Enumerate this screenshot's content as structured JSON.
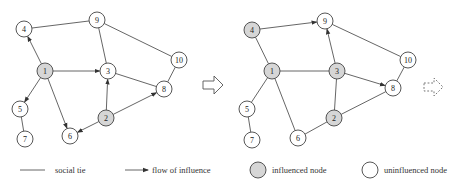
{
  "colors": {
    "influenced_fill": "#d6d6d6",
    "uninfluenced_fill": "#ffffff",
    "stroke": "#444444"
  },
  "graphs": [
    {
      "name": "before",
      "nodes": [
        {
          "id": "1",
          "x": 45,
          "y": 71,
          "influenced": true
        },
        {
          "id": "2",
          "x": 106,
          "y": 118,
          "influenced": true
        },
        {
          "id": "3",
          "x": 108,
          "y": 71,
          "influenced": false
        },
        {
          "id": "4",
          "x": 24,
          "y": 29,
          "influenced": false
        },
        {
          "id": "5",
          "x": 20,
          "y": 109,
          "influenced": false
        },
        {
          "id": "6",
          "x": 70,
          "y": 136,
          "influenced": false
        },
        {
          "id": "7",
          "x": 25,
          "y": 139,
          "influenced": false
        },
        {
          "id": "8",
          "x": 164,
          "y": 89,
          "influenced": false
        },
        {
          "id": "9",
          "x": 97,
          "y": 20,
          "influenced": false
        },
        {
          "id": "10",
          "x": 179,
          "y": 60,
          "influenced": false
        }
      ],
      "edges": [
        {
          "from": "4",
          "to": "9",
          "directed": false
        },
        {
          "from": "1",
          "to": "4",
          "directed": true
        },
        {
          "from": "1",
          "to": "3",
          "directed": true
        },
        {
          "from": "1",
          "to": "5",
          "directed": true
        },
        {
          "from": "1",
          "to": "6",
          "directed": true
        },
        {
          "from": "9",
          "to": "3",
          "directed": false
        },
        {
          "from": "9",
          "to": "10",
          "directed": false
        },
        {
          "from": "3",
          "to": "8",
          "directed": false
        },
        {
          "from": "10",
          "to": "8",
          "directed": false
        },
        {
          "from": "2",
          "to": "3",
          "directed": true
        },
        {
          "from": "2",
          "to": "8",
          "directed": true
        },
        {
          "from": "2",
          "to": "6",
          "directed": true
        },
        {
          "from": "5",
          "to": "7",
          "directed": false
        }
      ]
    },
    {
      "name": "after",
      "nodes": [
        {
          "id": "1",
          "x": 272,
          "y": 71,
          "influenced": true
        },
        {
          "id": "2",
          "x": 334,
          "y": 118,
          "influenced": true
        },
        {
          "id": "3",
          "x": 337,
          "y": 71,
          "influenced": true
        },
        {
          "id": "4",
          "x": 252,
          "y": 30,
          "influenced": true
        },
        {
          "id": "5",
          "x": 247,
          "y": 109,
          "influenced": false
        },
        {
          "id": "6",
          "x": 298,
          "y": 138,
          "influenced": false
        },
        {
          "id": "7",
          "x": 252,
          "y": 140,
          "influenced": false
        },
        {
          "id": "8",
          "x": 393,
          "y": 88,
          "influenced": false
        },
        {
          "id": "9",
          "x": 325,
          "y": 21,
          "influenced": false
        },
        {
          "id": "10",
          "x": 408,
          "y": 60,
          "influenced": false
        }
      ],
      "edges": [
        {
          "from": "4",
          "to": "9",
          "directed": true
        },
        {
          "from": "4",
          "to": "1",
          "directed": false
        },
        {
          "from": "1",
          "to": "3",
          "directed": false
        },
        {
          "from": "1",
          "to": "5",
          "directed": false
        },
        {
          "from": "1",
          "to": "6",
          "directed": false
        },
        {
          "from": "3",
          "to": "9",
          "directed": true
        },
        {
          "from": "9",
          "to": "10",
          "directed": false
        },
        {
          "from": "3",
          "to": "8",
          "directed": true
        },
        {
          "from": "10",
          "to": "8",
          "directed": false
        },
        {
          "from": "2",
          "to": "3",
          "directed": false
        },
        {
          "from": "2",
          "to": "8",
          "directed": false
        },
        {
          "from": "2",
          "to": "6",
          "directed": false
        },
        {
          "from": "5",
          "to": "7",
          "directed": false
        }
      ]
    }
  ],
  "transition_arrow": {
    "x": 200,
    "y": 84
  },
  "continuation_arrow": {
    "x": 425,
    "y": 88,
    "style": "dashed"
  },
  "legend": {
    "social_tie": "social tie",
    "flow_of_influence": "flow of influence",
    "influenced_node": "influenced node",
    "uninfluenced_node": "uninfluenced node"
  }
}
